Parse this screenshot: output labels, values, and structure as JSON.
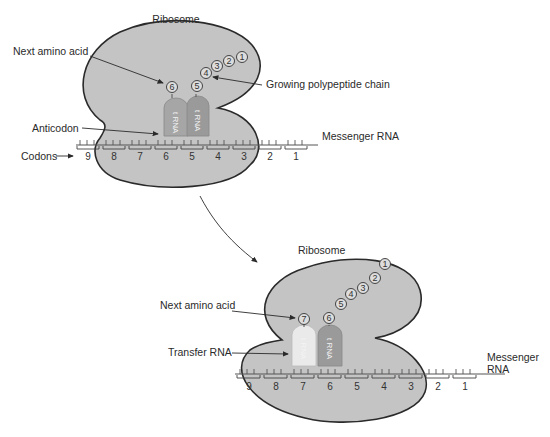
{
  "colors": {
    "background": "#ffffff",
    "ribosome_fill": "#c4c4c4",
    "ribosome_stroke": "#2a2a2a",
    "trna_dark": "#9a9a9a",
    "trna_light": "#e6e6e6",
    "text": "#2a2a2a"
  },
  "panel_top": {
    "ribosome_label": "Ribosome",
    "next_amino_acid_label": "Next amino acid",
    "growing_chain_label": "Growing polypeptide chain",
    "anticodon_label": "Anticodon",
    "mrna_label": "Messenger RNA",
    "codons_label": "Codons",
    "chain_amino_acids": [
      "1",
      "2",
      "3",
      "4",
      "5"
    ],
    "next_amino_acid": "6",
    "trna_left_text": "t RNA",
    "trna_right_text": "t RNA",
    "codon_numbers": [
      "9",
      "8",
      "7",
      "6",
      "5",
      "4",
      "3",
      "2",
      "1"
    ]
  },
  "panel_bottom": {
    "ribosome_label": "Ribosome",
    "next_amino_acid_label": "Next amino acid",
    "transfer_rna_label": "Transfer RNA",
    "mrna_label_line1": "Messenger",
    "mrna_label_line2": "RNA",
    "chain_amino_acids": [
      "1",
      "2",
      "3",
      "4",
      "5",
      "6"
    ],
    "next_amino_acid": "7",
    "trna_left_text": "t RNA",
    "trna_right_text": "t RNA",
    "codon_numbers": [
      "9",
      "8",
      "7",
      "6",
      "5",
      "4",
      "3",
      "2",
      "1"
    ]
  }
}
